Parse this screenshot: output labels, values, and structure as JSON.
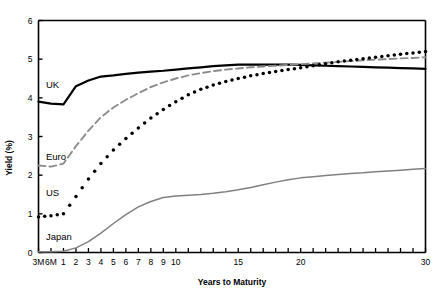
{
  "chart_data": {
    "type": "line",
    "title": "",
    "xlabel": "Years to Maturity",
    "ylabel": "Yield (%)",
    "ylim": [
      0,
      6
    ],
    "yticks": [
      0,
      1,
      2,
      3,
      4,
      5,
      6
    ],
    "ytick_labels": [
      "0",
      "1",
      "2",
      "3",
      "4",
      "5",
      "6"
    ],
    "grid": false,
    "legend_position": "inline-labels",
    "x_categories": [
      "3M",
      "6M",
      "1",
      "2",
      "3",
      "4",
      "5",
      "6",
      "7",
      "8",
      "9",
      "10",
      "11",
      "12",
      "13",
      "14",
      "15",
      "16",
      "17",
      "18",
      "19",
      "20",
      "21",
      "22",
      "23",
      "24",
      "25",
      "26",
      "27",
      "28",
      "29",
      "30"
    ],
    "xtick_labels_shown": [
      "3M",
      "6M",
      "1",
      "2",
      "3",
      "4",
      "5",
      "6",
      "7",
      "8",
      "9",
      "10",
      "",
      "",
      "",
      "",
      "15",
      "",
      "",
      "",
      "",
      "20",
      "",
      "",
      "",
      "",
      "",
      "",
      "",
      "",
      "",
      "30"
    ],
    "series": [
      {
        "name": "UK",
        "style": "solid",
        "color": "#000000",
        "width": 2.2,
        "label_x": "3M",
        "values": [
          3.9,
          3.85,
          3.83,
          4.3,
          4.45,
          4.55,
          4.58,
          4.62,
          4.65,
          4.68,
          4.7,
          4.73,
          4.76,
          4.79,
          4.82,
          4.84,
          4.86,
          4.86,
          4.86,
          4.86,
          4.86,
          4.85,
          4.84,
          4.83,
          4.82,
          4.81,
          4.8,
          4.79,
          4.78,
          4.77,
          4.76,
          4.75
        ]
      },
      {
        "name": "Euro",
        "style": "dashed",
        "color": "#8c8c8c",
        "width": 1.9,
        "values": [
          2.25,
          2.22,
          2.3,
          2.75,
          3.15,
          3.5,
          3.75,
          3.95,
          4.12,
          4.28,
          4.4,
          4.5,
          4.58,
          4.64,
          4.69,
          4.73,
          4.76,
          4.79,
          4.81,
          4.83,
          4.85,
          4.87,
          4.89,
          4.91,
          4.93,
          4.95,
          4.97,
          4.99,
          5.0,
          5.02,
          5.03,
          5.05
        ]
      },
      {
        "name": "US",
        "style": "dotted",
        "color": "#000000",
        "width": 3.0,
        "values": [
          0.92,
          0.95,
          1.0,
          1.45,
          1.9,
          2.3,
          2.65,
          2.95,
          3.22,
          3.48,
          3.7,
          3.9,
          4.08,
          4.22,
          4.33,
          4.42,
          4.5,
          4.57,
          4.63,
          4.68,
          4.73,
          4.78,
          4.83,
          4.88,
          4.93,
          4.97,
          5.01,
          5.05,
          5.09,
          5.13,
          5.16,
          5.2
        ]
      },
      {
        "name": "Japan",
        "style": "solid",
        "color": "#808080",
        "width": 1.5,
        "values": [
          0.02,
          0.02,
          0.03,
          0.12,
          0.28,
          0.5,
          0.75,
          0.98,
          1.18,
          1.32,
          1.42,
          1.46,
          1.48,
          1.5,
          1.53,
          1.57,
          1.62,
          1.68,
          1.75,
          1.82,
          1.88,
          1.93,
          1.96,
          1.99,
          2.02,
          2.04,
          2.06,
          2.09,
          2.11,
          2.13,
          2.15,
          2.17
        ]
      }
    ],
    "series_labels": [
      {
        "name": "UK",
        "text": "UK"
      },
      {
        "name": "Euro",
        "text": "Euro"
      },
      {
        "name": "US",
        "text": "US"
      },
      {
        "name": "Japan",
        "text": "Japan"
      }
    ]
  }
}
